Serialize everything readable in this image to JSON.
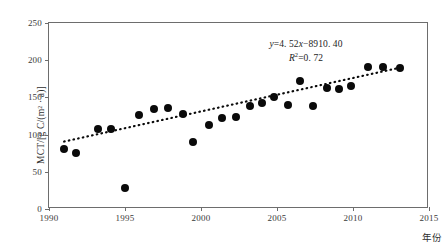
{
  "chart_data": {
    "type": "scatter",
    "title": "",
    "xlabel": "年份",
    "ylabel": "MCT/[g C/(m² · a)]",
    "xlim": [
      1990,
      2015
    ],
    "ylim": [
      0,
      250
    ],
    "xticks": [
      1990,
      1995,
      2000,
      2005,
      2010,
      2015
    ],
    "yticks": [
      0,
      50,
      100,
      150,
      200,
      250
    ],
    "grid": false,
    "legend": "none",
    "series": [
      {
        "name": "MCT",
        "marker": "filled-circle",
        "color": "#0a0a0a",
        "points": [
          {
            "x": 1991.0,
            "y": 80
          },
          {
            "x": 1991.8,
            "y": 75
          },
          {
            "x": 1993.2,
            "y": 108
          },
          {
            "x": 1994.1,
            "y": 107
          },
          {
            "x": 1995.0,
            "y": 28
          },
          {
            "x": 1995.9,
            "y": 127
          },
          {
            "x": 1996.9,
            "y": 134
          },
          {
            "x": 1997.8,
            "y": 136
          },
          {
            "x": 1998.8,
            "y": 128
          },
          {
            "x": 1999.5,
            "y": 90
          },
          {
            "x": 2000.5,
            "y": 113
          },
          {
            "x": 2001.4,
            "y": 122
          },
          {
            "x": 2002.3,
            "y": 123
          },
          {
            "x": 2003.2,
            "y": 138
          },
          {
            "x": 2004.0,
            "y": 143
          },
          {
            "x": 2004.8,
            "y": 150
          },
          {
            "x": 2005.7,
            "y": 140
          },
          {
            "x": 2006.5,
            "y": 172
          },
          {
            "x": 2007.4,
            "y": 138
          },
          {
            "x": 2008.3,
            "y": 163
          },
          {
            "x": 2009.1,
            "y": 161
          },
          {
            "x": 2009.9,
            "y": 165
          },
          {
            "x": 2011.0,
            "y": 191
          },
          {
            "x": 2012.0,
            "y": 191
          },
          {
            "x": 2013.1,
            "y": 190
          }
        ]
      }
    ],
    "trendline": {
      "style": "dotted",
      "color": "#0a0a0a",
      "slope": 4.52,
      "intercept": -8910.4,
      "r_squared": 0.72,
      "x_start": 1991.0,
      "x_end": 2013.4
    },
    "annotations": {
      "equation": "y=4.52x−8910.40",
      "r2": "R²=0.72",
      "equation_parts": {
        "y": "y",
        "eq": "=4. 52",
        "x": "x",
        "rest": "−8910. 40"
      },
      "r2_parts": {
        "r": "R",
        "sup": "2",
        "rest": "=0. 72"
      }
    }
  }
}
